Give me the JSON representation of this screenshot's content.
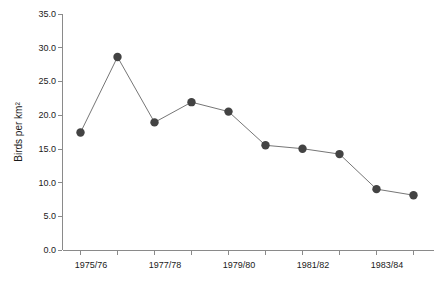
{
  "chart_data": {
    "type": "line",
    "title": "",
    "xlabel": "",
    "ylabel": "Birds per km²",
    "ylim": [
      0.0,
      35.0
    ],
    "ytick_step": 5.0,
    "ytick_labels": [
      "0.0",
      "5.0",
      "10.0",
      "15.0",
      "20.0",
      "25.0",
      "30.0",
      "35.0"
    ],
    "ytick_values": [
      0.0,
      5.0,
      10.0,
      15.0,
      20.0,
      25.0,
      30.0,
      35.0
    ],
    "grid": false,
    "legend": null,
    "categories": [
      "1975/76",
      "1976/77",
      "1977/78",
      "1978/79",
      "1979/80",
      "1980/81",
      "1981/82",
      "1982/83",
      "1983/84",
      "1984/85"
    ],
    "xtick_labels_visible": [
      "1975/76",
      "1977/78",
      "1979/80",
      "1981/82",
      "1983/84"
    ],
    "xtick_label_indices": [
      0,
      2,
      4,
      6,
      8
    ],
    "values": [
      17.5,
      28.7,
      19.0,
      22.0,
      20.6,
      15.6,
      15.1,
      14.3,
      9.1,
      8.2
    ],
    "marker": "filled-circle",
    "marker_color": "#434343",
    "line_color": "#767676",
    "axis_color": "#8a8a8a",
    "background_color": "#ffffff"
  }
}
